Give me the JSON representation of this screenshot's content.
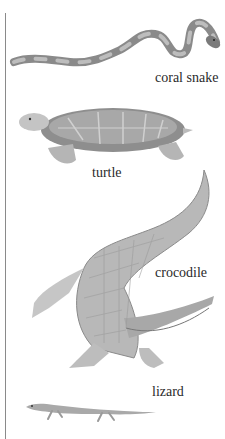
{
  "illustration": {
    "title": "Reptiles",
    "animals": [
      {
        "name": "coral snake"
      },
      {
        "name": "turtle"
      },
      {
        "name": "crocodile"
      },
      {
        "name": "lizard"
      }
    ]
  },
  "colors": {
    "ink": "#2a2a2a",
    "rule": "#8a8a8a",
    "shade_dark": "#6e6e6e",
    "shade_mid": "#9c9c9c",
    "shade_light": "#d2d2d2"
  }
}
